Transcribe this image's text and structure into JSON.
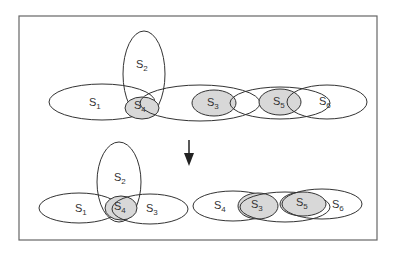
{
  "diagram": {
    "top": {
      "sets": [
        {
          "id": "S1",
          "base": "S",
          "sub": "1"
        },
        {
          "id": "S2",
          "base": "S",
          "sub": "2"
        },
        {
          "id": "S4",
          "base": "S",
          "sub": "4",
          "shaded": true
        },
        {
          "id": "S3",
          "base": "S",
          "sub": "3",
          "shaded": true
        },
        {
          "id": "S5",
          "base": "S",
          "sub": "5",
          "shaded": true
        },
        {
          "id": "S6",
          "base": "S",
          "sub": "6"
        }
      ]
    },
    "arrow": "down-arrow",
    "bottom_left": {
      "sets": [
        {
          "id": "S1",
          "base": "S",
          "sub": "1"
        },
        {
          "id": "S2",
          "base": "S",
          "sub": "2"
        },
        {
          "id": "S4",
          "base": "S",
          "sub": "4",
          "shaded": true
        },
        {
          "id": "S3",
          "base": "S",
          "sub": "3"
        }
      ]
    },
    "bottom_right": {
      "sets": [
        {
          "id": "S4",
          "base": "S",
          "sub": "4"
        },
        {
          "id": "S3",
          "base": "S",
          "sub": "3",
          "shaded": true
        },
        {
          "id": "S5",
          "base": "S",
          "sub": "5",
          "shaded": true
        },
        {
          "id": "S6",
          "base": "S",
          "sub": "6"
        }
      ]
    },
    "colors": {
      "stroke": "#333333",
      "shade": "#d8d8d8",
      "border": "#666666"
    }
  }
}
